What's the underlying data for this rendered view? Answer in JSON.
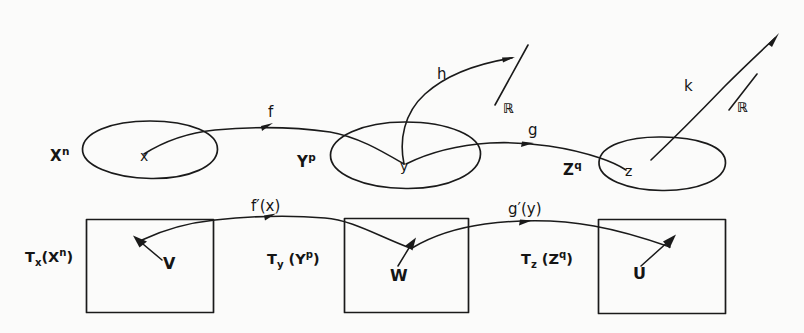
{
  "figure": {
    "type": "hand-drawn-diagram",
    "ink_color": "#1a1a1a",
    "background_color": "#fbfbfa",
    "width": 804,
    "height": 333
  },
  "manifolds": [
    {
      "id": "X",
      "label": "X",
      "exponent": "n",
      "point_label": "x",
      "shape": "blob-ellipse"
    },
    {
      "id": "Y",
      "label": "Y",
      "exponent": "p",
      "point_label": "y",
      "shape": "blob-ellipse"
    },
    {
      "id": "Z",
      "label": "Z",
      "exponent": "q",
      "point_label": "z",
      "shape": "blob-ellipse"
    }
  ],
  "maps": [
    {
      "id": "f",
      "label": "f",
      "from": "X",
      "to": "Y"
    },
    {
      "id": "g",
      "label": "g",
      "from": "Y",
      "to": "Z"
    },
    {
      "id": "h",
      "label": "h",
      "from": "Y",
      "to": "R"
    },
    {
      "id": "k",
      "label": "k",
      "from": "Z",
      "to": "R"
    }
  ],
  "real_lines": [
    {
      "id": "R1",
      "label": "ℝ"
    },
    {
      "id": "R2",
      "label": "ℝ"
    }
  ],
  "tangent_spaces": [
    {
      "id": "TX",
      "label": "T",
      "sub": "x",
      "arg": "X",
      "arg_exponent": "n",
      "vector_label": "V"
    },
    {
      "id": "TY",
      "label": "T",
      "sub": "y",
      "arg": "Y",
      "arg_exponent": "p",
      "vector_label": "W"
    },
    {
      "id": "TZ",
      "label": "T",
      "sub": "z",
      "arg": "Z",
      "arg_exponent": "q",
      "vector_label": "U"
    }
  ],
  "derivative_maps": [
    {
      "id": "df",
      "label": "f′(x)",
      "from": "TX",
      "to": "TY"
    },
    {
      "id": "dg",
      "label": "g′(y)",
      "from": "TY",
      "to": "TZ"
    }
  ]
}
